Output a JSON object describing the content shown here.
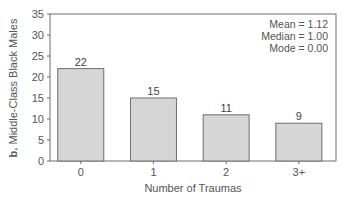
{
  "chart_data": {
    "type": "bar",
    "title": "",
    "panel_label": "b.",
    "ylabel": "Middle-Class Black Males",
    "xlabel": "Number of Traumas",
    "categories": [
      "0",
      "1",
      "2",
      "3+"
    ],
    "values": [
      22,
      15,
      11,
      9
    ],
    "data_labels": [
      "22",
      "15",
      "11",
      "9"
    ],
    "ylim": [
      0,
      35
    ],
    "yticks": [
      0,
      5,
      10,
      15,
      20,
      25,
      30,
      35
    ],
    "grid": false,
    "legend": null,
    "annotations": [
      "Mean = 1.12",
      "Median = 1.00",
      "Mode = 0.00"
    ],
    "colors": {
      "bar_fill": "#d6d6d6",
      "bar_stroke": "#6e6e6e",
      "axis": "#6e6e6e"
    }
  },
  "stats": {
    "mean": "Mean = 1.12",
    "median": "Median = 1.00",
    "mode": "Mode = 0.00"
  },
  "axes": {
    "ylabel_prefix": "b.",
    "ylabel_text": " Middle-Class Black Males",
    "xlabel": "Number of Traumas"
  }
}
